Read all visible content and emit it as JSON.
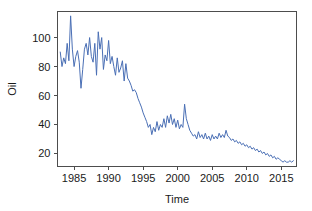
{
  "chart_data": {
    "type": "line",
    "title": "",
    "subtitle": "",
    "xlabel": "Time",
    "ylabel": "Oil",
    "xlim": [
      1982.6,
      2017.2
    ],
    "ylim": [
      11,
      118
    ],
    "grid": false,
    "legend": null,
    "xticks": [
      1985,
      1990,
      1995,
      2000,
      2005,
      2010,
      2015
    ],
    "xtick_labels": [
      "1985",
      "1990",
      "1995",
      "2000",
      "2005",
      "2010",
      "2015"
    ],
    "yticks": [
      20,
      40,
      60,
      80,
      100
    ],
    "ytick_labels": [
      "20",
      "40",
      "60",
      "80",
      "100"
    ],
    "series": [
      {
        "name": "Oil",
        "color": "#4a6fb5",
        "x": [
          1983.0,
          1983.25,
          1983.5,
          1983.75,
          1984.0,
          1984.25,
          1984.5,
          1984.75,
          1985.0,
          1985.25,
          1985.5,
          1985.75,
          1986.0,
          1986.25,
          1986.5,
          1986.75,
          1987.0,
          1987.25,
          1987.5,
          1987.75,
          1988.0,
          1988.25,
          1988.5,
          1988.75,
          1989.0,
          1989.25,
          1989.5,
          1989.75,
          1990.0,
          1990.25,
          1990.5,
          1990.75,
          1991.0,
          1991.25,
          1991.5,
          1991.75,
          1992.0,
          1992.25,
          1992.5,
          1992.75,
          1993.0,
          1993.25,
          1993.5,
          1993.75,
          1994.0,
          1994.25,
          1994.5,
          1994.75,
          1995.0,
          1995.25,
          1995.5,
          1995.75,
          1996.0,
          1996.25,
          1996.5,
          1996.75,
          1997.0,
          1997.25,
          1997.5,
          1997.75,
          1998.0,
          1998.25,
          1998.5,
          1998.75,
          1999.0,
          1999.25,
          1999.5,
          1999.75,
          2000.0,
          2000.25,
          2000.5,
          2000.75,
          2001.0,
          2001.25,
          2001.5,
          2001.75,
          2002.0,
          2002.25,
          2002.5,
          2002.75,
          2003.0,
          2003.25,
          2003.5,
          2003.75,
          2004.0,
          2004.25,
          2004.5,
          2004.75,
          2005.0,
          2005.25,
          2005.5,
          2005.75,
          2006.0,
          2006.25,
          2006.5,
          2006.75,
          2007.0,
          2007.25,
          2007.5,
          2007.75,
          2008.0,
          2008.25,
          2008.5,
          2008.75,
          2009.0,
          2009.25,
          2009.5,
          2009.75,
          2010.0,
          2010.25,
          2010.5,
          2010.75,
          2011.0,
          2011.25,
          2011.5,
          2011.75,
          2012.0,
          2012.25,
          2012.5,
          2012.75,
          2013.0,
          2013.25,
          2013.5,
          2013.75,
          2014.0,
          2014.25,
          2014.5,
          2014.75,
          2015.0,
          2015.25,
          2015.5,
          2015.75,
          2016.0,
          2016.25,
          2016.5,
          2016.75
        ],
        "y": [
          90,
          80,
          86,
          82,
          96,
          84,
          115,
          92,
          80,
          87,
          91,
          83,
          65,
          78,
          92,
          96,
          88,
          100,
          87,
          83,
          96,
          74,
          104,
          92,
          100,
          78,
          88,
          84,
          98,
          82,
          87,
          80,
          74,
          86,
          76,
          79,
          84,
          70,
          82,
          72,
          70,
          67,
          63,
          64,
          62,
          58,
          55,
          52,
          48,
          45,
          42,
          38,
          40,
          33,
          38,
          35,
          42,
          36,
          40,
          38,
          44,
          38,
          46,
          41,
          47,
          40,
          44,
          38,
          43,
          37,
          40,
          38,
          54,
          44,
          40,
          36,
          34,
          32,
          33,
          30,
          35,
          31,
          33,
          30,
          34,
          30,
          32,
          29,
          33,
          30,
          32,
          30,
          34,
          31,
          33,
          31,
          36,
          32,
          31,
          29,
          30,
          28,
          29,
          27,
          28,
          26,
          27,
          25,
          26,
          24,
          25,
          23,
          24,
          22,
          23,
          21,
          22,
          20,
          21,
          19,
          20,
          18,
          19,
          17,
          18,
          16,
          17,
          16,
          15,
          14,
          15,
          14,
          14,
          15,
          14,
          15
        ]
      }
    ]
  },
  "axes": {
    "ylabel": "Oil",
    "xlabel": "Time"
  }
}
